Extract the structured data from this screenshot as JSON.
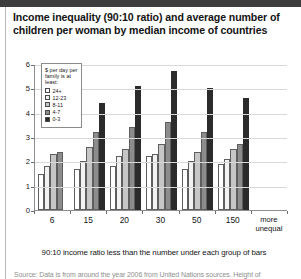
{
  "title": "Income inequality (90:10 ratio) and average number of children per woman by median income of countries",
  "legend": {
    "title": "$ per day per family is at least:",
    "items": [
      {
        "label": "24+",
        "color": "#ffffff"
      },
      {
        "label": "12-23",
        "color": "#f2f2f2"
      },
      {
        "label": "8-11",
        "color": "#c6c6c6"
      },
      {
        "label": "4-7",
        "color": "#8c8c8c"
      },
      {
        "label": "0-3",
        "color": "#2b2b2b"
      }
    ]
  },
  "chart_data": {
    "type": "bar",
    "title": "Income inequality (90:10 ratio) and average number of children per woman by median income of countries",
    "xlabel": "90:10 income ratio less than the number under each group of bars",
    "ylabel": "Babies per woman (lifetime)",
    "ylim": [
      0,
      6
    ],
    "yticks": [
      0,
      1,
      2,
      3,
      4,
      5,
      6
    ],
    "ytick_labels": [
      "0",
      "1",
      "2",
      "3",
      "4",
      "5",
      "6"
    ],
    "grid": true,
    "legend_position": "upper-left-inside",
    "categories": [
      "6",
      "15",
      "20",
      "30",
      "50",
      "150",
      "more unequal"
    ],
    "series": [
      {
        "name": "24+",
        "values": [
          1.5,
          1.7,
          1.8,
          2.2,
          1.7,
          1.9,
          null
        ]
      },
      {
        "name": "12-23",
        "values": [
          1.8,
          2.0,
          2.2,
          2.3,
          2.0,
          2.1,
          null
        ]
      },
      {
        "name": "8-11",
        "values": [
          2.3,
          2.6,
          2.5,
          2.7,
          2.4,
          2.5,
          null
        ]
      },
      {
        "name": "4-7",
        "values": [
          2.4,
          3.2,
          3.4,
          3.6,
          3.2,
          2.7,
          null
        ]
      },
      {
        "name": "0-3",
        "values": [
          null,
          4.4,
          5.1,
          5.7,
          5.0,
          4.6,
          null
        ]
      }
    ]
  },
  "axis": {
    "more_unequal_line1": "more",
    "more_unequal_line2": "unequal"
  },
  "source": "Source: Data is from around the year 2006 from United Nations sources. Height of"
}
